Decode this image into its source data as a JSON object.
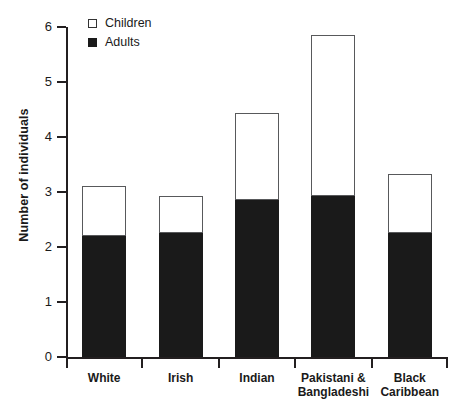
{
  "chart_data": {
    "type": "bar",
    "stacked": true,
    "title": "",
    "xlabel": "",
    "ylabel": "Number of individuals",
    "ylim": [
      0,
      6
    ],
    "yticks": [
      0,
      1,
      2,
      3,
      4,
      5,
      6
    ],
    "ytick_labels": [
      "0",
      "1",
      "2",
      "3",
      "4",
      "5",
      "6"
    ],
    "grid": false,
    "legend_position": "top-left",
    "categories": [
      "White",
      "Irish",
      "Indian",
      "Pakistani &\nBangladeshi",
      "Black\nCaribbean"
    ],
    "series": [
      {
        "name": "Adults",
        "color": "#1a1a1a",
        "values": [
          2.2,
          2.25,
          2.85,
          2.93,
          2.25
        ]
      },
      {
        "name": "Children",
        "color": "#ffffff",
        "values": [
          0.91,
          0.68,
          1.58,
          2.92,
          1.08
        ]
      }
    ],
    "totals": [
      3.11,
      2.93,
      4.43,
      5.85,
      3.33
    ]
  },
  "legend": {
    "items": [
      {
        "label": "Children",
        "swatch": "open-square"
      },
      {
        "label": "Adults",
        "swatch": "filled-square"
      }
    ]
  },
  "colors": {
    "adults": "#1a1a1a",
    "children": "#ffffff",
    "outline": "#58595b",
    "axis": "#231f20",
    "background": "#ffffff"
  }
}
